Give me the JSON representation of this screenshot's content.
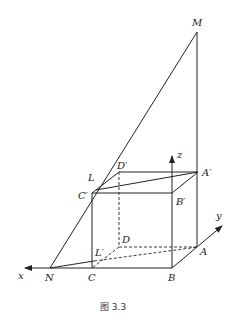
{
  "figure": {
    "caption": "图 3.3",
    "points": {
      "M": "M",
      "N": "N",
      "L": "L",
      "Lp": "L′",
      "A": "A",
      "B": "B",
      "C": "C",
      "D": "D",
      "Ap": "A′",
      "Bp": "B′",
      "Cp": "C′",
      "Dp": "D′"
    },
    "axes": {
      "x": "x",
      "y": "y",
      "z": "z"
    }
  }
}
